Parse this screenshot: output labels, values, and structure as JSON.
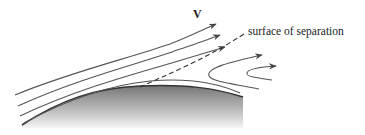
{
  "diagram": {
    "labels": {
      "velocity": "V",
      "separation": "surface of separation"
    },
    "colors": {
      "streamline": "#555555",
      "body_dark": "#7a7a7a",
      "body_light": "#f2f2f2",
      "text": "#222222"
    },
    "elements": {
      "streamlines_count": 4,
      "recirculation_lines_count": 2,
      "separation_line_style": "dashed"
    }
  }
}
